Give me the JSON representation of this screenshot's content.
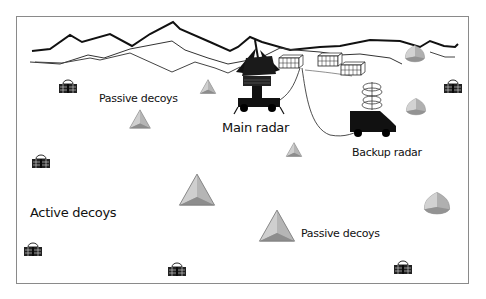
{
  "diagram": {
    "labels": {
      "passive_decoys_top": "Passive decoys",
      "main_radar": "Main radar",
      "backup_radar": "Backup radar",
      "active_decoys": "Active decoys",
      "passive_decoys_bottom": "Passive decoys"
    },
    "elements": {
      "main_radar": {
        "type": "radar-vehicle",
        "x": 258,
        "y": 85
      },
      "backup_radar": {
        "type": "radar-truck",
        "x": 375,
        "y": 110
      },
      "shelters": [
        {
          "x": 290,
          "y": 62
        },
        {
          "x": 330,
          "y": 60
        },
        {
          "x": 352,
          "y": 70
        }
      ],
      "passive_decoys": [
        {
          "shape": "pyramid",
          "x": 208,
          "y": 88,
          "size": "small"
        },
        {
          "shape": "pyramid",
          "x": 140,
          "y": 121,
          "size": "medium"
        },
        {
          "shape": "pyramid",
          "x": 294,
          "y": 151,
          "size": "small"
        },
        {
          "shape": "pyramid",
          "x": 197,
          "y": 193,
          "size": "large"
        },
        {
          "shape": "pyramid",
          "x": 277,
          "y": 229,
          "size": "large"
        }
      ],
      "rounded_decoys": [
        {
          "x": 415,
          "y": 55
        },
        {
          "x": 416,
          "y": 108
        },
        {
          "x": 437,
          "y": 205
        }
      ],
      "active_decoys": [
        {
          "x": 68,
          "y": 87
        },
        {
          "x": 41,
          "y": 162
        },
        {
          "x": 453,
          "y": 87
        },
        {
          "x": 33,
          "y": 250
        },
        {
          "x": 177,
          "y": 270
        },
        {
          "x": 403,
          "y": 268
        }
      ]
    },
    "colors": {
      "decoy_light": "#c9c9c9",
      "decoy_mid": "#a9a9a9",
      "decoy_dark": "#8c8c8c",
      "ink": "#111111",
      "frame": "#8a8a8a"
    }
  }
}
